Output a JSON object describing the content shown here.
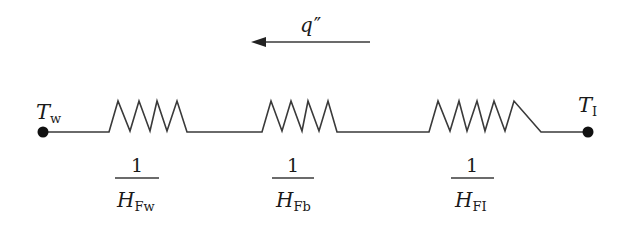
{
  "diagram": {
    "type": "thermal-resistance-circuit",
    "colors": {
      "line": "#3a3a3a",
      "text": "#1a1a1a",
      "node": "#111111",
      "background": "#ffffff"
    },
    "heat_flux": {
      "symbol": "q",
      "prime": "″",
      "direction": "left"
    },
    "nodes": [
      {
        "id": "left",
        "symbol": "T",
        "subscript": "w"
      },
      {
        "id": "right",
        "symbol": "T",
        "subscript": "I"
      }
    ],
    "resistors": [
      {
        "numerator": "1",
        "symbol": "H",
        "subscript": "Fw"
      },
      {
        "numerator": "1",
        "symbol": "H",
        "subscript": "Fb"
      },
      {
        "numerator": "1",
        "symbol": "H",
        "subscript": "FI"
      }
    ]
  }
}
